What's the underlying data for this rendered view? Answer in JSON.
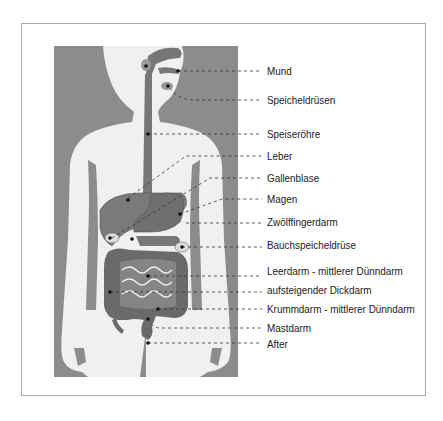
{
  "diagram": {
    "type": "anatomical digestive system",
    "language": "de",
    "colors": {
      "background_panel": "#8c8c8c",
      "body_silhouette": "#f0f0f0",
      "organs": "#777777",
      "organs_dark": "#5f5f5f",
      "leader_lines": "#333333",
      "frame": "#a9a9a9",
      "label_text": "#222222"
    },
    "labels": [
      {
        "id": "mund",
        "text": "Mund"
      },
      {
        "id": "speicheldruesen",
        "text": "Speicheldrüsen"
      },
      {
        "id": "speiseroehre",
        "text": "Speiseröhre"
      },
      {
        "id": "leber",
        "text": "Leber"
      },
      {
        "id": "gallenblase",
        "text": "Gallenblase"
      },
      {
        "id": "magen",
        "text": "Magen"
      },
      {
        "id": "zwoelffingerdarm",
        "text": "Zwölffingerdarm"
      },
      {
        "id": "bauchspeicheldruese",
        "text": "Bauchspeicheldrüse"
      },
      {
        "id": "leerdarm",
        "text": "Leerdarm - mittlerer Dünndarm"
      },
      {
        "id": "dickdarm",
        "text": "aufsteigender Dickdarm"
      },
      {
        "id": "krummdarm",
        "text": "Krummdarm - mittlerer Dünndarm"
      },
      {
        "id": "mastdarm",
        "text": "Mastdarm"
      },
      {
        "id": "after",
        "text": "After"
      }
    ]
  }
}
